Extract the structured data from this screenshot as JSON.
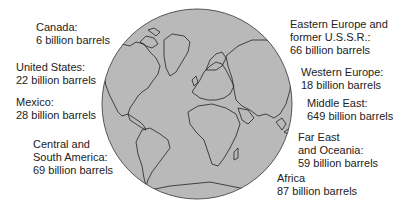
{
  "globe": {
    "fill": "#b9b9b9",
    "outline": "#444444",
    "coast": "#222222"
  },
  "regions": [
    {
      "name": "Canada:",
      "lines": [
        "Canada:",
        "6 billion barrels"
      ],
      "value": 6
    },
    {
      "name": "United States:",
      "lines": [
        "United States:",
        "22 billion barrels"
      ],
      "value": 22
    },
    {
      "name": "Mexico:",
      "lines": [
        "Mexico:",
        "28 billion barrels"
      ],
      "value": 28
    },
    {
      "name": "Central and South America:",
      "lines": [
        "Central and",
        "South America:",
        "69 billion barrels"
      ],
      "value": 69
    },
    {
      "name": "Eastern Europe and former U.S.S.R.:",
      "lines": [
        "Eastern Europe and",
        "former U.S.S.R.:",
        "66 billion barrels"
      ],
      "value": 66
    },
    {
      "name": "Western Europe:",
      "lines": [
        "Western Europe:",
        "18 billion barrels"
      ],
      "value": 18
    },
    {
      "name": "Middle East:",
      "lines": [
        "Middle East:",
        "649 billion barrels"
      ],
      "value": 649
    },
    {
      "name": "Far East and Oceania:",
      "lines": [
        "Far East",
        "and Oceania:",
        "59 billion barrels"
      ],
      "value": 59
    },
    {
      "name": "Africa",
      "lines": [
        "Africa",
        "87 billion barrels"
      ],
      "value": 87
    }
  ],
  "unit": "billion barrels"
}
